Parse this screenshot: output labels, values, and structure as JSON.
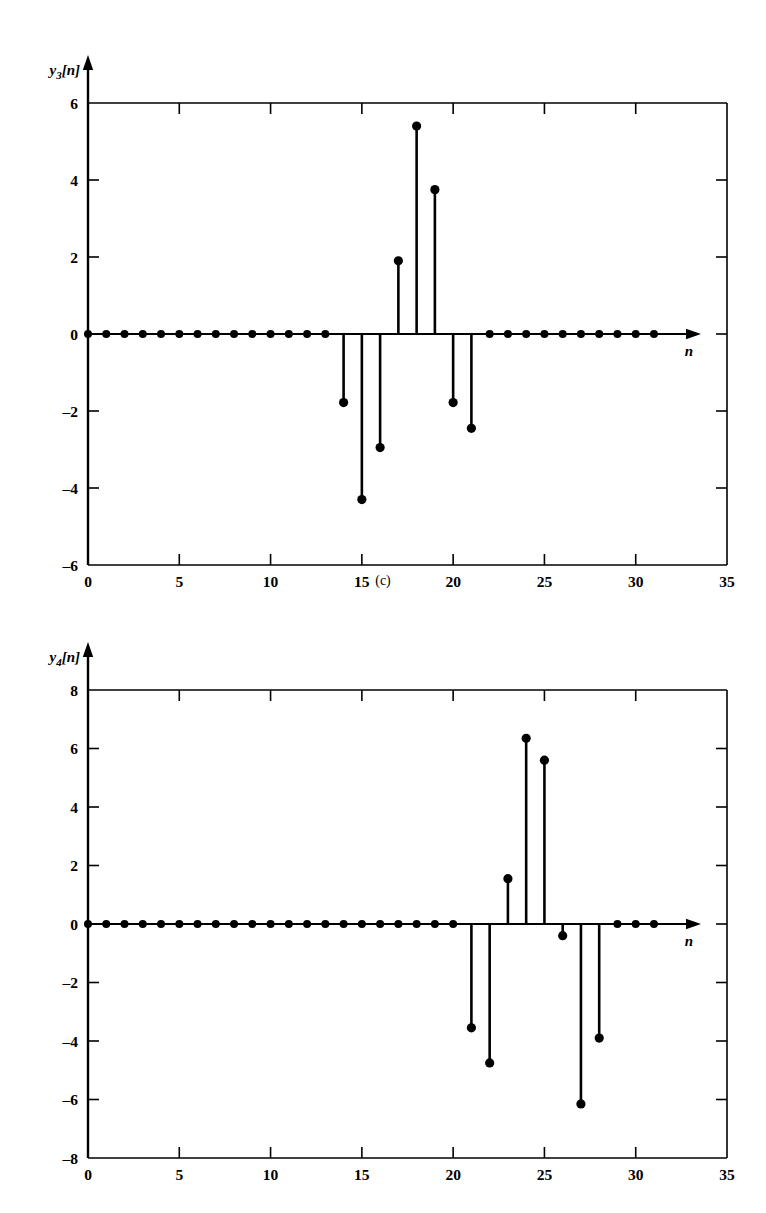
{
  "figure": {
    "panels": [
      {
        "id": "c",
        "caption": "(c)",
        "ylabel": "y3[n]",
        "ylabel_base": "y",
        "ylabel_sub": "3",
        "ylabel_rest": "[n]",
        "xlabel": "n"
      },
      {
        "id": "d",
        "caption": "(d)",
        "ylabel": "y4[n]",
        "ylabel_base": "y",
        "ylabel_sub": "4",
        "ylabel_rest": "[n]",
        "xlabel": "n"
      }
    ],
    "colors": {
      "ink": "#000000",
      "background": "#ffffff"
    }
  },
  "chart_data": [
    {
      "type": "scatter",
      "panel": "c",
      "title": "",
      "subtitle": "(c)",
      "xlabel": "n",
      "ylabel": "y3[n]",
      "xlim": [
        0,
        35
      ],
      "ylim": [
        -6,
        6
      ],
      "xticks": [
        0,
        5,
        10,
        15,
        20,
        25,
        30,
        35
      ],
      "xticklabels": [
        "0",
        "5",
        "10",
        "15",
        "20",
        "25",
        "30",
        "35"
      ],
      "yticks": [
        -6,
        -4,
        -2,
        0,
        2,
        4,
        6
      ],
      "yticklabels": [
        "-6",
        "-4",
        "-2",
        "0",
        "2",
        "4",
        "6"
      ],
      "grid": false,
      "legend": "none",
      "marker": "filled-circle",
      "stem_plot": true,
      "x": [
        0,
        1,
        2,
        3,
        4,
        5,
        6,
        7,
        8,
        9,
        10,
        11,
        12,
        13,
        14,
        15,
        16,
        17,
        18,
        19,
        20,
        21,
        22,
        23,
        24,
        25,
        26,
        27,
        28,
        29,
        30,
        31
      ],
      "values": [
        0,
        0,
        0,
        0,
        0,
        0,
        0,
        0,
        0,
        0,
        0,
        0,
        0,
        0,
        -1.78,
        -4.3,
        -2.95,
        1.9,
        5.4,
        3.75,
        -1.78,
        -2.45,
        0,
        0,
        0,
        0,
        0,
        0,
        0,
        0,
        0,
        0
      ]
    },
    {
      "type": "scatter",
      "panel": "d",
      "title": "",
      "subtitle": "(d)",
      "xlabel": "n",
      "ylabel": "y4[n]",
      "xlim": [
        0,
        35
      ],
      "ylim": [
        -8,
        8
      ],
      "xticks": [
        0,
        5,
        10,
        15,
        20,
        25,
        30,
        35
      ],
      "xticklabels": [
        "0",
        "5",
        "10",
        "15",
        "20",
        "25",
        "30",
        "35"
      ],
      "yticks": [
        -8,
        -6,
        -4,
        -2,
        0,
        2,
        4,
        6,
        8
      ],
      "yticklabels": [
        "-8",
        "-6",
        "-4",
        "-2",
        "0",
        "2",
        "4",
        "6",
        "8"
      ],
      "grid": false,
      "legend": "none",
      "marker": "filled-circle",
      "stem_plot": true,
      "x": [
        0,
        1,
        2,
        3,
        4,
        5,
        6,
        7,
        8,
        9,
        10,
        11,
        12,
        13,
        14,
        15,
        16,
        17,
        18,
        19,
        20,
        21,
        22,
        23,
        24,
        25,
        26,
        27,
        28,
        29,
        30,
        31
      ],
      "values": [
        0,
        0,
        0,
        0,
        0,
        0,
        0,
        0,
        0,
        0,
        0,
        0,
        0,
        0,
        0,
        0,
        0,
        0,
        0,
        0,
        0,
        -3.55,
        -4.75,
        1.55,
        6.35,
        5.6,
        -0.4,
        -6.15,
        -3.9,
        0,
        0,
        0
      ]
    }
  ]
}
